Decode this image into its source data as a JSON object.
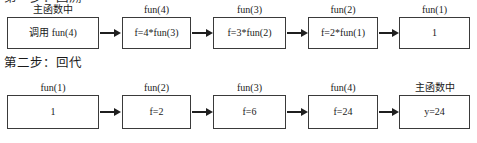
{
  "figure": {
    "headings": {
      "step1": "第一步：回溯",
      "step2": "第二步：回代"
    },
    "rows": [
      {
        "id": "recursion-trace-row",
        "nodes": [
          {
            "caption": "主函数中",
            "value": "调用 fun(4)"
          },
          {
            "caption": "fun(4)",
            "value": "f=4*fun(3)"
          },
          {
            "caption": "fun(3)",
            "value": "f=3*fun(2)"
          },
          {
            "caption": "fun(2)",
            "value": "f=2*fun(1)"
          },
          {
            "caption": "fun(1)",
            "value": "1"
          }
        ]
      },
      {
        "id": "backsubstitution-row",
        "nodes": [
          {
            "caption": "fun(1)",
            "value": "1"
          },
          {
            "caption": "fun(2)",
            "value": "f=2"
          },
          {
            "caption": "fun(3)",
            "value": "f=6"
          },
          {
            "caption": "fun(4)",
            "value": "f=24"
          },
          {
            "caption": "主函数中",
            "value": "y=24"
          }
        ]
      }
    ],
    "colors": {
      "box_border": "#3a3a3a",
      "arrow": "#1f1f1f",
      "background": "#ffffff",
      "text": "#1a1a1a"
    }
  }
}
